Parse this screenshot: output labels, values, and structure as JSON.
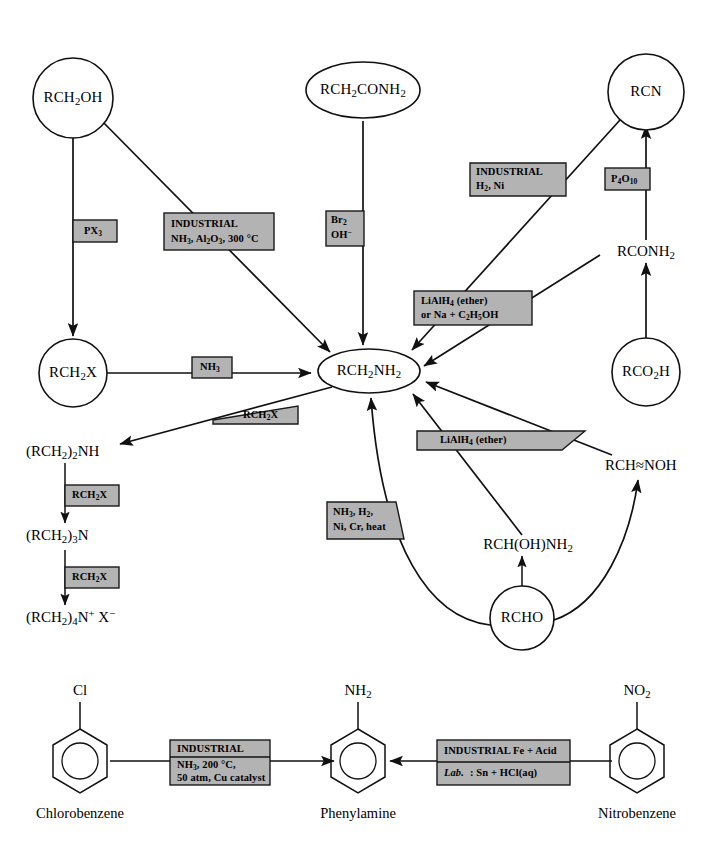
{
  "page": {
    "width": 713,
    "height": 861,
    "background": "#ffffff",
    "label_box_fill": "#b3b3b3",
    "stroke_color": "#111111"
  },
  "upper_scheme": {
    "center_node": "RCH2NH2",
    "nodes": {
      "rch2oh": "RCH₂OH",
      "rch2x": "RCH₂X",
      "rch2conh2": "RCH₂CONH₂",
      "rcn": "RCN",
      "rconh2": "RCONH₂",
      "rco2h": "RCO₂H",
      "rch2nh2": "RCH₂NH₂",
      "secondary_amine": "(RCH₂)₂NH",
      "tertiary_amine": "(RCH₂)₃N",
      "quaternary_salt": "(RCH₂)₄N⁺ X⁻",
      "rchnoh": "RCH═NOH",
      "rchohnh2": "RCH(OH)NH₂",
      "rcho": "RCHO"
    },
    "reagent_labels": {
      "px3": {
        "lines": [
          "PX₃"
        ]
      },
      "industrial_nh3_al2o3": {
        "lines": [
          "INDUSTRIAL",
          "NH₃, Al₂O₃, 300 °C"
        ]
      },
      "br2_oh": {
        "lines": [
          "Br₂",
          "OH⁻"
        ]
      },
      "industrial_h2_ni": {
        "lines": [
          "INDUSTRIAL",
          "H₂, Ni"
        ]
      },
      "p4o10": {
        "lines": [
          "P₄O₁₀"
        ]
      },
      "lialh4_or_na": {
        "lines": [
          "LiAlH₄ (ether)",
          "or Na + C₂H₅OH"
        ]
      },
      "nh3": {
        "lines": [
          "NH₃"
        ]
      },
      "rch2x_tri": {
        "lines": [
          "RCH₂X"
        ]
      },
      "lialh4_ether_tri": {
        "lines": [
          "LiAlH₄ (ether)"
        ]
      },
      "nh3_h2_ni_cr": {
        "lines": [
          "NH₃, H₂,",
          "Ni, Cr, heat"
        ]
      },
      "rch2x_chain_1": {
        "lines": [
          "RCH₂X"
        ]
      },
      "rch2x_chain_2": {
        "lines": [
          "RCH₂X"
        ]
      }
    }
  },
  "lower_scheme": {
    "substituent_left": "Cl",
    "substituent_middle": "NH₂",
    "substituent_right": "NO₂",
    "caption_left": "Chlorobenzene",
    "caption_middle": "Phenylamine",
    "caption_right": "Nitrobenzene",
    "reagent_left": {
      "line1": "INDUSTRIAL",
      "line2": "NH₃, 200 °C,",
      "line3": "50 atm, Cu catalyst"
    },
    "reagent_right": {
      "line1": "INDUSTRIAL Fe + Acid",
      "line2_italic": "Lab.",
      "line2_rest": ": Sn + HCl(aq)"
    }
  }
}
